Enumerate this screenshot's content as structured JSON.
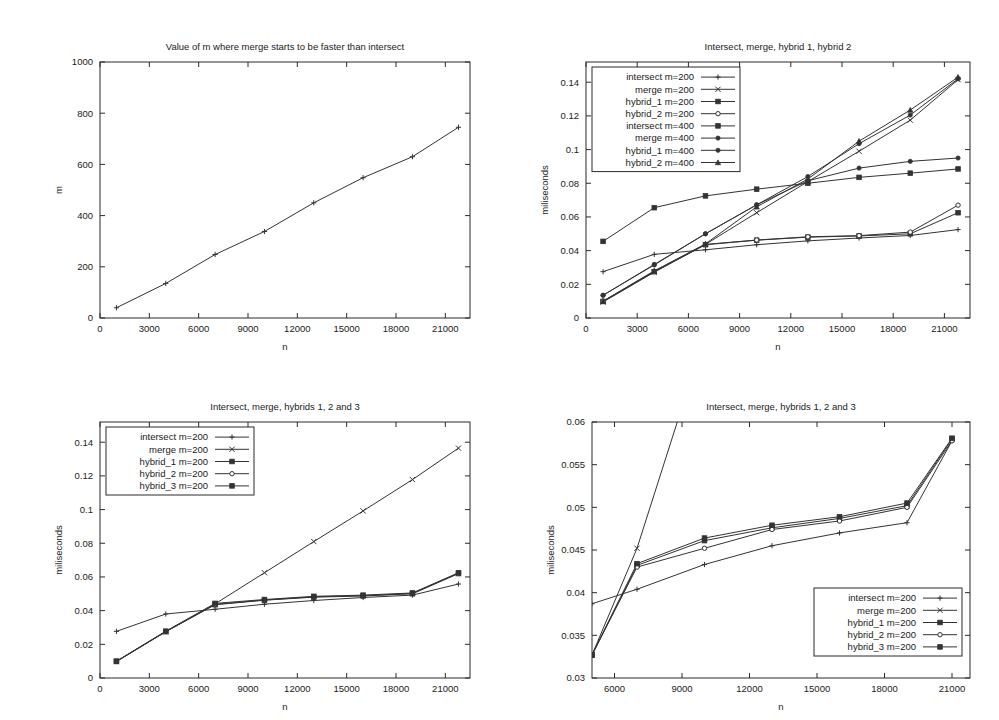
{
  "page": {
    "background": "#ffffff",
    "ink": "#333333",
    "panel_count": 4
  },
  "chart_data": [
    {
      "id": "panel-1",
      "type": "line",
      "title": "Value of m where merge starts to be faster than intersect",
      "xlabel": "n",
      "ylabel": "m",
      "xlim": [
        0,
        22500
      ],
      "ylim": [
        0,
        1000
      ],
      "xticks": [
        0,
        3000,
        6000,
        9000,
        12000,
        15000,
        18000,
        21000
      ],
      "xticklabels": [
        "0",
        "3000",
        "6000",
        "9000",
        "12000",
        "15000",
        "18000",
        "21000"
      ],
      "yticks": [
        0,
        200,
        400,
        600,
        800,
        1000
      ],
      "yticklabels": [
        "0",
        "200",
        "400",
        "600",
        "800",
        "1000"
      ],
      "grid": false,
      "legend": null,
      "x": [
        1000,
        4000,
        7000,
        10000,
        13000,
        16000,
        19000,
        21800
      ],
      "series": [
        {
          "name": "m crossover",
          "marker": "plus",
          "values": [
            40,
            135,
            248,
            338,
            450,
            548,
            630,
            745
          ]
        }
      ]
    },
    {
      "id": "panel-2",
      "type": "line",
      "title": "Intersect, merge, hybrid 1, hybrid 2",
      "xlabel": "n",
      "ylabel": "miliseconds",
      "xlim": [
        0,
        22500
      ],
      "ylim": [
        0,
        0.152
      ],
      "xticks": [
        0,
        3000,
        6000,
        9000,
        12000,
        15000,
        18000,
        21000
      ],
      "xticklabels": [
        "0",
        "3000",
        "6000",
        "9000",
        "12000",
        "15000",
        "18000",
        "21000"
      ],
      "yticks": [
        0,
        0.02,
        0.04,
        0.06,
        0.08,
        0.1,
        0.12,
        0.14
      ],
      "yticklabels": [
        "0",
        "0.02",
        "0.04",
        "0.06",
        "0.08",
        "0.1",
        "0.12",
        "0.14"
      ],
      "grid": false,
      "legend": {
        "position": "top-left"
      },
      "x": [
        1000,
        4000,
        7000,
        10000,
        13000,
        16000,
        19000,
        21800
      ],
      "series": [
        {
          "name": "intersect m=200",
          "marker": "plus",
          "values": [
            0.0275,
            0.0378,
            0.0405,
            0.0435,
            0.0458,
            0.0475,
            0.049,
            0.0525
          ]
        },
        {
          "name": "merge m=200",
          "marker": "cross",
          "values": [
            0.0095,
            0.0272,
            0.0437,
            0.0625,
            0.081,
            0.099,
            0.1175,
            0.1415
          ]
        },
        {
          "name": "hybrid_1 m=200",
          "marker": "square-filled",
          "values": [
            0.0098,
            0.0275,
            0.0435,
            0.0462,
            0.048,
            0.0487,
            0.05,
            0.0625
          ]
        },
        {
          "name": "hybrid_2 m=200",
          "marker": "circle-open",
          "values": [
            0.01,
            0.0277,
            0.0437,
            0.0463,
            0.0482,
            0.0489,
            0.051,
            0.067
          ]
        },
        {
          "name": "intersect m=400",
          "marker": "square-solid",
          "values": [
            0.0455,
            0.0655,
            0.0725,
            0.0765,
            0.08,
            0.0835,
            0.086,
            0.0885
          ]
        },
        {
          "name": "merge m=400",
          "marker": "circle-solid",
          "values": [
            0.0135,
            0.0315,
            0.05,
            0.0672,
            0.084,
            0.1035,
            0.1205,
            0.142
          ]
        },
        {
          "name": "hybrid_1 m=400",
          "marker": "dot-solid",
          "values": [
            0.0135,
            0.0318,
            0.05,
            0.0672,
            0.0815,
            0.089,
            0.093,
            0.095
          ]
        },
        {
          "name": "hybrid_2 m=400",
          "marker": "triangle-solid",
          "values": [
            0.01,
            0.028,
            0.044,
            0.066,
            0.0825,
            0.105,
            0.1235,
            0.143
          ]
        }
      ]
    },
    {
      "id": "panel-3",
      "type": "line",
      "title": "Intersect, merge, hybrids 1, 2 and 3",
      "xlabel": "n",
      "ylabel": "miliseconds",
      "xlim": [
        0,
        22500
      ],
      "ylim": [
        0,
        0.152
      ],
      "xticks": [
        0,
        3000,
        6000,
        9000,
        12000,
        15000,
        18000,
        21000
      ],
      "xticklabels": [
        "0",
        "3000",
        "6000",
        "9000",
        "12000",
        "15000",
        "18000",
        "21000"
      ],
      "yticks": [
        0,
        0.02,
        0.04,
        0.06,
        0.08,
        0.1,
        0.12,
        0.14
      ],
      "yticklabels": [
        "0",
        "0.02",
        "0.04",
        "0.06",
        "0.08",
        "0.1",
        "0.12",
        "0.14"
      ],
      "grid": false,
      "legend": {
        "position": "top-left"
      },
      "x": [
        1000,
        4000,
        7000,
        10000,
        13000,
        16000,
        19000,
        21800
      ],
      "series": [
        {
          "name": "intersect m=200",
          "marker": "plus",
          "values": [
            0.0277,
            0.038,
            0.0408,
            0.0438,
            0.046,
            0.0478,
            0.0492,
            0.0558
          ]
        },
        {
          "name": "merge m=200",
          "marker": "cross",
          "values": [
            0.0098,
            0.0275,
            0.044,
            0.0625,
            0.081,
            0.0992,
            0.1178,
            0.1365
          ]
        },
        {
          "name": "hybrid_1 m=200",
          "marker": "square-filled",
          "values": [
            0.0098,
            0.0275,
            0.0435,
            0.0462,
            0.048,
            0.0487,
            0.05,
            0.062
          ]
        },
        {
          "name": "hybrid_2 m=200",
          "marker": "circle-open",
          "values": [
            0.0099,
            0.0276,
            0.0437,
            0.0463,
            0.0482,
            0.0489,
            0.0502,
            0.0622
          ]
        },
        {
          "name": "hybrid_3 m=200",
          "marker": "square-solid",
          "values": [
            0.01,
            0.0278,
            0.0443,
            0.0466,
            0.0485,
            0.0492,
            0.0505,
            0.0625
          ]
        }
      ]
    },
    {
      "id": "panel-4",
      "type": "line",
      "title": "Intersect, merge, hybrids 1, 2 and 3",
      "xlabel": "n",
      "ylabel": "miliseconds",
      "xlim": [
        5000,
        21800
      ],
      "ylim": [
        0.03,
        0.06
      ],
      "xticks": [
        6000,
        9000,
        12000,
        15000,
        18000,
        21000
      ],
      "xticklabels": [
        "6000",
        "9000",
        "12000",
        "15000",
        "18000",
        "21000"
      ],
      "yticks": [
        0.03,
        0.035,
        0.04,
        0.045,
        0.05,
        0.055,
        0.06
      ],
      "yticklabels": [
        "0.03",
        "0.035",
        "0.04",
        "0.045",
        "0.05",
        "0.055",
        "0.06"
      ],
      "grid": false,
      "legend": {
        "position": "bottom-right"
      },
      "x": [
        5000,
        7000,
        10000,
        13000,
        16000,
        19000,
        21000
      ],
      "series": [
        {
          "name": "intersect m=200",
          "marker": "plus",
          "values": [
            0.0387,
            0.0404,
            0.0433,
            0.0455,
            0.047,
            0.0482,
            0.0578
          ]
        },
        {
          "name": "merge m=200",
          "marker": "cross",
          "values": [
            0.0327,
            0.0452,
            0.07,
            0.09,
            0.1,
            0.11,
            0.12
          ]
        },
        {
          "name": "hybrid_1 m=200",
          "marker": "square-filled",
          "values": [
            0.0327,
            0.0432,
            0.0461,
            0.0476,
            0.0487,
            0.0502,
            0.058
          ]
        },
        {
          "name": "hybrid_2 m=200",
          "marker": "circle-open",
          "values": [
            0.0327,
            0.043,
            0.0452,
            0.0474,
            0.0484,
            0.05,
            0.0578
          ]
        },
        {
          "name": "hybrid_3 m=200",
          "marker": "square-solid",
          "values": [
            0.0327,
            0.0434,
            0.0464,
            0.0479,
            0.0489,
            0.0505,
            0.0581
          ]
        }
      ]
    }
  ]
}
